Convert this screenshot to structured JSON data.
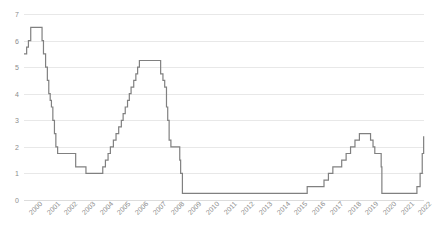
{
  "chart_data": {
    "type": "line",
    "line_style": "step",
    "title": "",
    "subtitle": "",
    "xlabel": "",
    "ylabel": "",
    "ylim": [
      0,
      7
    ],
    "yticks": [
      0,
      1,
      2,
      3,
      4,
      5,
      6,
      7
    ],
    "ytick_labels": [
      "0",
      "1",
      "2",
      "3",
      "4",
      "5",
      "6",
      "7"
    ],
    "grid": true,
    "grid_axis": "y",
    "legend": false,
    "legend_position": "none",
    "xlim": [
      2000,
      2022.6
    ],
    "categories": [
      "2000",
      "2001",
      "2002",
      "2003",
      "2004",
      "2005",
      "2006",
      "2007",
      "2008",
      "2009",
      "2010",
      "2011",
      "2012",
      "2013",
      "2014",
      "2015",
      "2016",
      "2017",
      "2018",
      "2019",
      "2020",
      "2021",
      "2022"
    ],
    "xtick_labels": [
      "2000",
      "2001",
      "2002",
      "2003",
      "2004",
      "2005",
      "2006",
      "2007",
      "2008",
      "2009",
      "2010",
      "2011",
      "2012",
      "2013",
      "2014",
      "2015",
      "2016",
      "2017",
      "2018",
      "2019",
      "2020",
      "2021",
      "2022"
    ],
    "line_color": "#808080",
    "grid_color": "#e8e8e8",
    "tick_label_color": "#8c8c8c",
    "background_color": "#ffffff",
    "series": [
      {
        "name": "Policy rate",
        "points": [
          [
            2000.0,
            5.5
          ],
          [
            2000.15,
            5.75
          ],
          [
            2000.25,
            6.0
          ],
          [
            2000.38,
            6.5
          ],
          [
            2000.95,
            6.5
          ],
          [
            2001.02,
            6.0
          ],
          [
            2001.1,
            5.5
          ],
          [
            2001.22,
            5.0
          ],
          [
            2001.32,
            4.5
          ],
          [
            2001.4,
            4.0
          ],
          [
            2001.48,
            3.75
          ],
          [
            2001.55,
            3.5
          ],
          [
            2001.63,
            3.0
          ],
          [
            2001.72,
            2.5
          ],
          [
            2001.8,
            2.0
          ],
          [
            2001.9,
            1.75
          ],
          [
            2002.0,
            1.75
          ],
          [
            2002.92,
            1.25
          ],
          [
            2003.5,
            1.0
          ],
          [
            2004.45,
            1.25
          ],
          [
            2004.6,
            1.5
          ],
          [
            2004.75,
            1.75
          ],
          [
            2004.88,
            2.0
          ],
          [
            2005.05,
            2.25
          ],
          [
            2005.2,
            2.5
          ],
          [
            2005.35,
            2.75
          ],
          [
            2005.5,
            3.0
          ],
          [
            2005.6,
            3.25
          ],
          [
            2005.72,
            3.5
          ],
          [
            2005.85,
            3.75
          ],
          [
            2005.95,
            4.0
          ],
          [
            2006.05,
            4.25
          ],
          [
            2006.2,
            4.5
          ],
          [
            2006.32,
            4.75
          ],
          [
            2006.42,
            5.0
          ],
          [
            2006.52,
            5.25
          ],
          [
            2007.7,
            5.25
          ],
          [
            2007.72,
            4.75
          ],
          [
            2007.85,
            4.5
          ],
          [
            2007.95,
            4.25
          ],
          [
            2008.05,
            3.5
          ],
          [
            2008.12,
            3.0
          ],
          [
            2008.2,
            2.25
          ],
          [
            2008.3,
            2.0
          ],
          [
            2008.8,
            1.5
          ],
          [
            2008.85,
            1.0
          ],
          [
            2008.95,
            0.25
          ],
          [
            2015.95,
            0.25
          ],
          [
            2016.0,
            0.5
          ],
          [
            2016.95,
            0.75
          ],
          [
            2017.2,
            1.0
          ],
          [
            2017.45,
            1.25
          ],
          [
            2017.95,
            1.5
          ],
          [
            2018.2,
            1.75
          ],
          [
            2018.45,
            2.0
          ],
          [
            2018.7,
            2.25
          ],
          [
            2018.95,
            2.5
          ],
          [
            2019.58,
            2.25
          ],
          [
            2019.72,
            2.0
          ],
          [
            2019.82,
            1.75
          ],
          [
            2020.18,
            1.25
          ],
          [
            2020.22,
            0.25
          ],
          [
            2022.2,
            0.5
          ],
          [
            2022.38,
            1.0
          ],
          [
            2022.5,
            1.75
          ],
          [
            2022.58,
            2.4
          ]
        ]
      }
    ]
  }
}
